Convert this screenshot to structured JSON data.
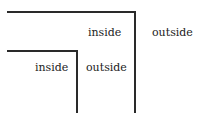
{
  "diagram": {
    "outer_box": {
      "inside_label": "inside",
      "outside_label": "outside"
    },
    "inner_box": {
      "inside_label": "inside",
      "outside_label": "outside"
    },
    "line_color": "#2a2a2a"
  }
}
